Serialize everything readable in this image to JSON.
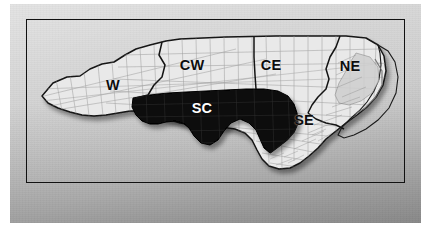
{
  "figure": {
    "kind": "map-figure",
    "frame_color": "#111111",
    "backdrop_color_top": "#d8d8d8",
    "backdrop_color_bottom": "#a2a2a2"
  },
  "map": {
    "state_fill": "#e9e9e9",
    "county_line_color": "#9a9a9a",
    "region_line_color": "#1a1a1a",
    "coast_outline_color": "#1a1a1a",
    "highlight_fill": "#0a0a0a",
    "shadow_color": "rgba(0,0,0,0.35)",
    "regions": [
      {
        "id": "W",
        "label": "W",
        "x": 113,
        "y": 85,
        "style": "dark",
        "highlighted": false
      },
      {
        "id": "CW",
        "label": "CW",
        "x": 192,
        "y": 65,
        "style": "dark",
        "highlighted": false
      },
      {
        "id": "CE",
        "label": "CE",
        "x": 271,
        "y": 65,
        "style": "dark",
        "highlighted": false
      },
      {
        "id": "NE",
        "label": "NE",
        "x": 350,
        "y": 66,
        "style": "dark",
        "highlighted": false
      },
      {
        "id": "SC",
        "label": "SC",
        "x": 202,
        "y": 108,
        "style": "light",
        "highlighted": true
      },
      {
        "id": "SE",
        "label": "SE",
        "x": 304,
        "y": 120,
        "style": "dark",
        "highlighted": false
      }
    ]
  }
}
